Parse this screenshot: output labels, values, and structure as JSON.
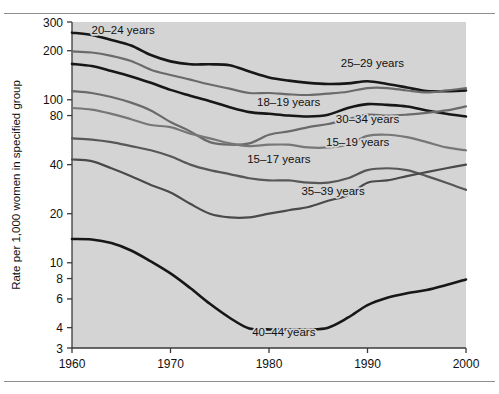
{
  "figure": {
    "background_color": "#ffffff",
    "plot_background_color": "#d4d4d4",
    "frame_color": "#8e8e8e",
    "title": "",
    "y_axis_title": "Rate per 1,000 women in specified group",
    "x_axis_title": ""
  },
  "chart_data": {
    "type": "line",
    "title": "",
    "xlabel": "",
    "ylabel": "Rate per 1,000 women in specified group",
    "xlim": [
      1960,
      2000
    ],
    "ylim": [
      3,
      300
    ],
    "yscale": "log",
    "grid": false,
    "legend": "inline-annotations",
    "x_ticks": [
      1960,
      1970,
      1980,
      1990,
      2000
    ],
    "x_tick_labels": [
      "1960",
      "1970",
      "1980",
      "1990",
      "2000"
    ],
    "y_ticks": [
      3,
      4,
      6,
      8,
      10,
      20,
      40,
      80,
      100,
      200,
      300
    ],
    "y_tick_labels": [
      "3",
      "4",
      "6",
      "8",
      "10",
      "20",
      "40",
      "80",
      "100",
      "200",
      "300"
    ],
    "x": [
      1960,
      1962,
      1964,
      1966,
      1968,
      1970,
      1972,
      1974,
      1976,
      1978,
      1980,
      1982,
      1984,
      1986,
      1988,
      1990,
      1992,
      1994,
      1996,
      1998,
      2000
    ],
    "series": [
      {
        "name": "20–24 years",
        "color": "#171717",
        "width": 2.6,
        "label": "20–24 years",
        "label_x": 1965.2,
        "label_y": 252,
        "values": [
          258,
          250,
          233,
          215,
          188,
          172,
          165,
          165,
          163,
          149,
          137,
          131,
          127,
          125,
          126,
          130,
          125,
          119,
          113,
          113,
          114
        ]
      },
      {
        "name": "25–29 years",
        "color": "#6a6a6a",
        "width": 2.2,
        "label": "25–29 years",
        "label_x": 1990.5,
        "label_y": 158,
        "values": [
          198,
          195,
          186,
          173,
          153,
          142,
          133,
          124,
          117,
          110,
          110,
          108,
          107,
          109,
          112,
          118,
          118,
          114,
          111,
          114,
          118
        ]
      },
      {
        "name": "18–19 years",
        "color": "#171717",
        "width": 2.6,
        "label": "18–19 years",
        "label_x": 1982.0,
        "label_y": 92,
        "values": [
          166,
          161,
          150,
          139,
          127,
          115,
          106,
          98,
          90,
          84,
          82,
          80,
          79,
          81,
          89,
          94,
          93,
          91,
          86,
          82,
          79
        ]
      },
      {
        "name": "30–34 years",
        "color": "#6a6a6a",
        "width": 2.2,
        "label": "30–34 years",
        "label_x": 1990.0,
        "label_y": 72,
        "values": [
          113,
          110,
          104,
          96,
          86,
          73,
          64,
          55,
          53,
          54,
          61,
          64,
          68,
          71,
          76,
          81,
          80,
          81,
          83,
          86,
          91
        ]
      },
      {
        "name": "15–19 years",
        "color": "#777777",
        "width": 2.2,
        "label": "15–19 years",
        "label_x": 1989.0,
        "label_y": 52,
        "values": [
          89,
          87,
          82,
          76,
          70,
          68,
          62,
          58,
          54,
          52,
          53,
          53,
          51,
          51,
          53,
          60,
          61,
          59,
          55,
          51,
          49
        ]
      },
      {
        "name": "15–17 years",
        "color": "#575757",
        "width": 2.2,
        "label": "15–17 years",
        "label_x": 1981.0,
        "label_y": 41,
        "values": [
          58,
          57,
          55,
          52,
          49,
          45,
          40,
          37,
          35,
          33,
          32,
          32,
          31,
          31,
          33,
          37,
          38,
          37,
          34,
          31,
          28
        ]
      },
      {
        "name": "35–39 years",
        "color": "#4a4a4a",
        "width": 2.2,
        "label": "35–39 years",
        "label_x": 1986.5,
        "label_y": 26,
        "values": [
          43,
          42,
          38,
          34,
          30,
          27,
          23,
          20,
          19,
          19,
          20,
          21,
          22,
          24,
          26,
          31,
          32,
          34,
          36,
          38,
          40
        ]
      },
      {
        "name": "40–44 years",
        "color": "#171717",
        "width": 2.6,
        "label": "40–44 years",
        "label_x": 1981.5,
        "label_y": 3.55,
        "values": [
          14.0,
          13.9,
          13.2,
          11.9,
          10.2,
          8.6,
          7.0,
          5.6,
          4.6,
          3.95,
          3.9,
          3.9,
          3.9,
          4.0,
          4.6,
          5.5,
          6.1,
          6.5,
          6.8,
          7.3,
          7.9
        ]
      }
    ]
  }
}
